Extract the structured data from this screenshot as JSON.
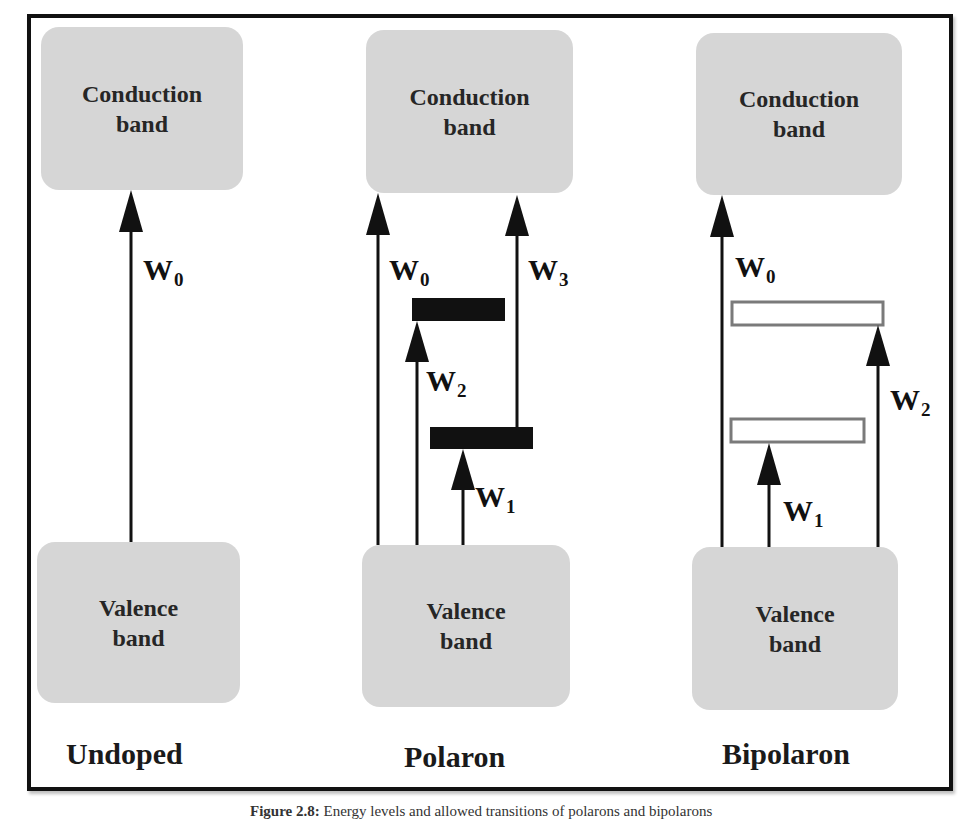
{
  "diagram": {
    "columns": [
      {
        "title": "Undoped",
        "conduction_band": {
          "line1": "Conduction",
          "line2": "band"
        },
        "valence_band": {
          "line1": "Valence",
          "line2": "band"
        },
        "levels": [],
        "transitions": [
          {
            "label": "W",
            "sub": "0",
            "from": "valence_band",
            "to": "conduction_band"
          }
        ]
      },
      {
        "title": "Polaron",
        "conduction_band": {
          "line1": "Conduction",
          "line2": "band"
        },
        "valence_band": {
          "line1": "Valence",
          "line2": "band"
        },
        "levels": [
          {
            "name": "upper-polaron-level",
            "style": "filled"
          },
          {
            "name": "lower-polaron-level",
            "style": "filled"
          }
        ],
        "transitions": [
          {
            "label": "W",
            "sub": "0",
            "from": "valence_band",
            "to": "conduction_band"
          },
          {
            "label": "W",
            "sub": "2",
            "from": "valence_band",
            "to": "upper-polaron-level"
          },
          {
            "label": "W",
            "sub": "1",
            "from": "valence_band",
            "to": "lower-polaron-level"
          },
          {
            "label": "W",
            "sub": "3",
            "from": "lower-polaron-level",
            "to": "conduction_band"
          }
        ]
      },
      {
        "title": "Bipolaron",
        "conduction_band": {
          "line1": "Conduction",
          "line2": "band"
        },
        "valence_band": {
          "line1": "Valence",
          "line2": "band"
        },
        "levels": [
          {
            "name": "upper-bipolaron-level",
            "style": "empty"
          },
          {
            "name": "lower-bipolaron-level",
            "style": "empty"
          }
        ],
        "transitions": [
          {
            "label": "W",
            "sub": "0",
            "from": "valence_band",
            "to": "conduction_band"
          },
          {
            "label": "W",
            "sub": "1",
            "from": "valence_band",
            "to": "lower-bipolaron-level"
          },
          {
            "label": "W",
            "sub": "2",
            "from": "valence_band",
            "to": "upper-bipolaron-level"
          }
        ]
      }
    ],
    "colors": {
      "band_fill": "#d6d6d6",
      "filled_level": "#111111",
      "empty_level_border": "#7a7a7a",
      "frame": "#111111"
    }
  },
  "caption": {
    "label": "Figure 2.8:",
    "text": "Energy levels and allowed transitions of polarons and bipolarons"
  }
}
